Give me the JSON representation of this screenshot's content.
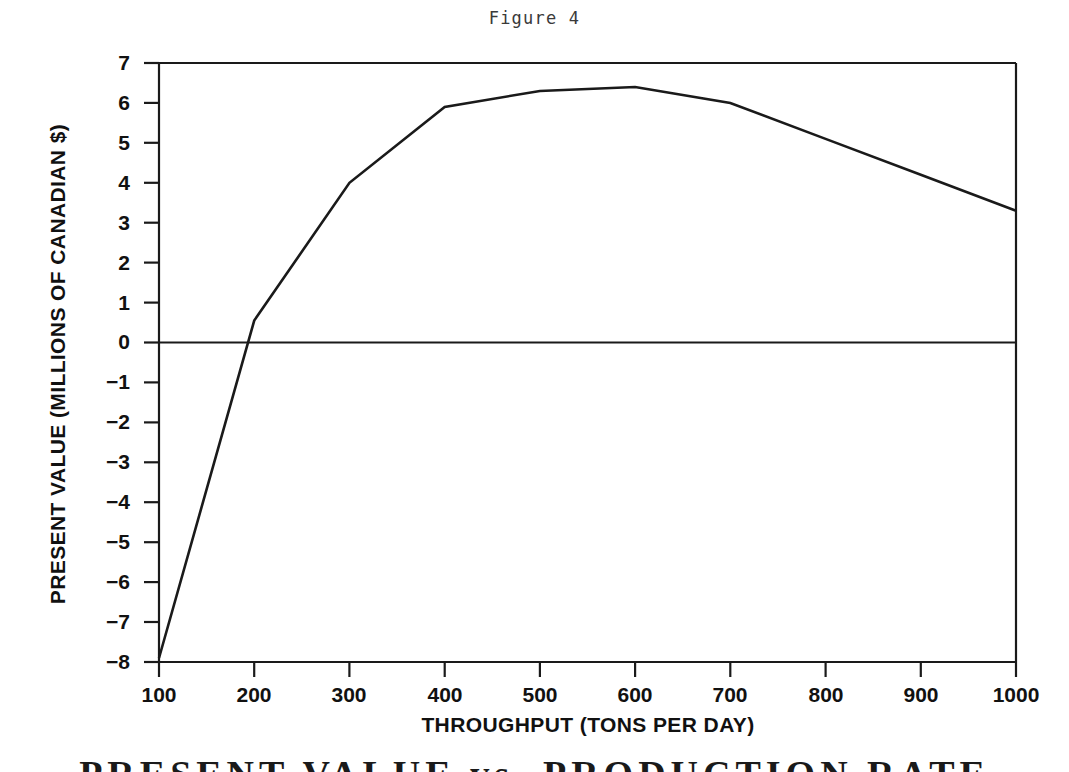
{
  "figure": {
    "title": "Figure 4",
    "caption": "PRESENT VALUE vs. PRODUCTION RATE"
  },
  "axes": {
    "x_title": "THROUGHPUT (TONS PER DAY)",
    "y_title": "PRESENT VALUE (MILLIONS OF CANADIAN $)",
    "x_tick_labels": [
      "100",
      "200",
      "300",
      "400",
      "500",
      "600",
      "700",
      "800",
      "900",
      "1000"
    ],
    "y_tick_labels": [
      "7",
      "6",
      "5",
      "4",
      "3",
      "2",
      "1",
      "0",
      "−1",
      "−2",
      "−3",
      "−4",
      "−5",
      "−6",
      "−7",
      "−8"
    ]
  },
  "style": {
    "line_color": "#1a1a1a",
    "axis_color": "#1a1a1a",
    "background": "#ffffff"
  },
  "chart_data": {
    "type": "line",
    "title": "Figure 4",
    "subtitle": "PRESENT VALUE vs. PRODUCTION RATE",
    "xlabel": "THROUGHPUT (TONS PER DAY)",
    "ylabel": "PRESENT VALUE (MILLIONS OF CANADIAN $)",
    "x": [
      100,
      200,
      300,
      400,
      500,
      600,
      700,
      800,
      900,
      1000
    ],
    "values": [
      -7.9,
      0.55,
      4.0,
      5.9,
      6.3,
      6.4,
      6.0,
      5.1,
      4.2,
      3.3
    ],
    "xlim": [
      100,
      1000
    ],
    "ylim": [
      -8,
      7
    ],
    "x_ticks": [
      100,
      200,
      300,
      400,
      500,
      600,
      700,
      800,
      900,
      1000
    ],
    "y_ticks": [
      -8,
      -7,
      -6,
      -5,
      -4,
      -3,
      -2,
      -1,
      0,
      1,
      2,
      3,
      4,
      5,
      6,
      7
    ],
    "grid": false,
    "legend": false,
    "zero_reference_line": 0,
    "series": [
      {
        "name": "Present Value",
        "values": [
          -7.9,
          0.55,
          4.0,
          5.9,
          6.3,
          6.4,
          6.0,
          5.1,
          4.2,
          3.3
        ]
      }
    ],
    "annotations": [
      {
        "label": "break-even throughput",
        "x": 195,
        "y": 0
      },
      {
        "label": "maximum present value",
        "x": 600,
        "y": 6.4
      }
    ]
  }
}
